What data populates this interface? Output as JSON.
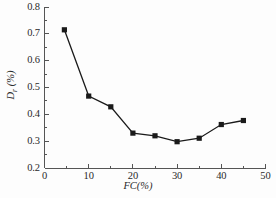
{
  "chart_data": {
    "type": "line",
    "title": "",
    "subtitle": "",
    "xlabel": "FC(%)",
    "ylabel": "D_r (%)",
    "ylabel_base": "D",
    "ylabel_sub": "r",
    "ylabel_unit": "(%)",
    "xlim": [
      0,
      50
    ],
    "ylim": [
      0.2,
      0.8
    ],
    "xticks": [
      0,
      10,
      20,
      30,
      40,
      50
    ],
    "xtick_labels": [
      "0",
      "10",
      "20",
      "30",
      "40",
      "50"
    ],
    "xminor_ticks": [
      5,
      15,
      25,
      35,
      45
    ],
    "yticks": [
      0.2,
      0.3,
      0.4,
      0.5,
      0.6,
      0.7,
      0.8
    ],
    "ytick_labels": [
      "0.2",
      "0.3",
      "0.4",
      "0.5",
      "0.6",
      "0.7",
      "0.8"
    ],
    "yminor_ticks": [
      0.25,
      0.35,
      0.45,
      0.55,
      0.65,
      0.75
    ],
    "grid": false,
    "legend": "none",
    "marker": "square",
    "marker_color": "#1a1a1a",
    "line_color": "#1a1a1a",
    "axis_color": "#555555",
    "x": [
      4.5,
      10,
      15,
      20,
      25,
      30,
      35,
      40,
      45
    ],
    "values": [
      0.715,
      0.468,
      0.428,
      0.33,
      0.32,
      0.298,
      0.311,
      0.362,
      0.377
    ],
    "series": [
      {
        "name": "Dr vs FC",
        "points": [
          {
            "x": 4.5,
            "y": 0.715
          },
          {
            "x": 10,
            "y": 0.468
          },
          {
            "x": 15,
            "y": 0.428
          },
          {
            "x": 20,
            "y": 0.33
          },
          {
            "x": 25,
            "y": 0.32
          },
          {
            "x": 30,
            "y": 0.298
          },
          {
            "x": 35,
            "y": 0.311
          },
          {
            "x": 40,
            "y": 0.362
          },
          {
            "x": 45,
            "y": 0.377
          }
        ]
      }
    ]
  }
}
